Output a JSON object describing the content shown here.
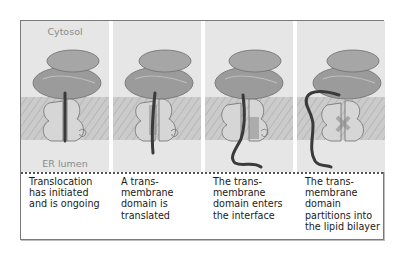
{
  "figure": {
    "type": "schematic",
    "compartments": {
      "top_label": "Cytosol",
      "bottom_label": "ER lumen"
    },
    "colors": {
      "background": "#e6e6e6",
      "membrane": "#c9c9c9",
      "ribosome": "#9a9a9a",
      "translocon": "#d4d4d4",
      "polypeptide": "#3a3a3a",
      "frame_border": "#7a7a7a"
    },
    "panels": [
      {
        "step": 1,
        "caption": "Translocation\nhas initiated\nand is ongoing",
        "chain_state": "straight-through-channel"
      },
      {
        "step": 2,
        "caption": "A trans-\nmembrane\ndomain is\ntranslated",
        "chain_state": "tm-in-channel"
      },
      {
        "step": 3,
        "caption": "The trans-\nmembrane\ndomain enters\nthe interface",
        "chain_state": "tm-at-lateral-gate"
      },
      {
        "step": 4,
        "caption": "The trans-\nmembrane\ndomain\npartitions into\nthe lipid bilayer",
        "chain_state": "tm-released-into-bilayer"
      }
    ]
  }
}
